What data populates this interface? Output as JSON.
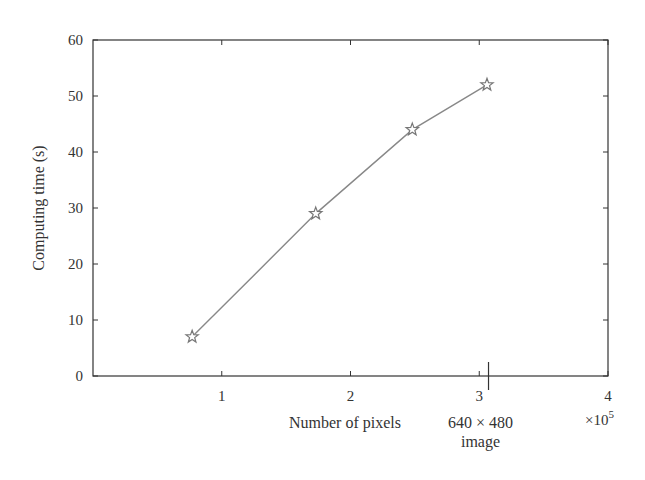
{
  "chart_data": {
    "type": "line",
    "title": "",
    "xlabel": "Number of pixels",
    "ylabel": "Computing time (s)",
    "x_multiplier_label": "×10",
    "x_multiplier_exp": "5",
    "xlim": [
      0,
      4
    ],
    "ylim": [
      0,
      60
    ],
    "x_ticks": [
      1,
      2,
      3,
      4
    ],
    "y_ticks": [
      0,
      10,
      20,
      30,
      40,
      50,
      60
    ],
    "grid": false,
    "legend": null,
    "marker": "star",
    "series": [
      {
        "name": "Computing time",
        "x": [
          0.77,
          1.73,
          2.48,
          3.06
        ],
        "y": [
          7,
          29,
          44,
          52
        ]
      }
    ],
    "annotations": [
      {
        "text_line1": "640 × 480",
        "text_line2": "image",
        "x": 3.072,
        "type": "long-tick"
      }
    ]
  },
  "colors": {
    "axis": "#333333",
    "line": "#888888",
    "marker": "#777777"
  }
}
